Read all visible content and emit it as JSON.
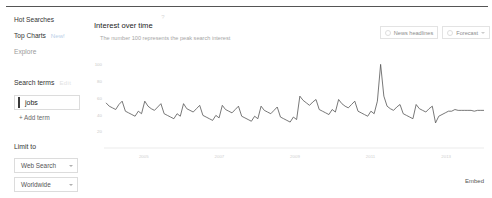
{
  "sidebar": {
    "nav": [
      {
        "label": "Hot Searches",
        "badge": "",
        "muted": false
      },
      {
        "label": "Top Charts",
        "badge": "New!",
        "muted": false
      },
      {
        "label": "Explore",
        "badge": "",
        "muted": true
      }
    ],
    "search_terms": {
      "title": "Search terms",
      "ghost": "Edit",
      "term": "jobs",
      "add_label": "+ Add term"
    },
    "limit_to": {
      "title": "Limit to",
      "options": [
        {
          "label": "Web Search"
        },
        {
          "label": "Worldwide"
        }
      ]
    }
  },
  "panel": {
    "title": "Interest over time",
    "help_icon": "question-mark-icon",
    "subtitle": "The number 100 represents the peak search interest",
    "toolbar": [
      {
        "label": "News headlines",
        "icon": "toggle-circle-icon",
        "has_caret": false
      },
      {
        "label": "Forecast",
        "icon": "toggle-circle-icon",
        "has_caret": true
      }
    ],
    "embed_label": "Embed"
  },
  "chart_data": {
    "type": "line",
    "title": "Interest over time",
    "subtitle": "The number 100 represents the peak search interest",
    "xlabel": "",
    "ylabel": "",
    "ylim": [
      0,
      110
    ],
    "yticks": [
      100,
      80,
      60,
      40,
      20
    ],
    "xticks": [
      "2005",
      "2007",
      "2009",
      "2011",
      "2013"
    ],
    "grid": false,
    "legend_position": "none",
    "series": [
      {
        "name": "jobs",
        "color": "#555555",
        "values": [
          54,
          50,
          48,
          46,
          52,
          56,
          44,
          42,
          40,
          38,
          44,
          41,
          56,
          50,
          47,
          45,
          49,
          53,
          41,
          39,
          37,
          35,
          41,
          38,
          53,
          47,
          45,
          43,
          47,
          51,
          39,
          37,
          35,
          33,
          39,
          36,
          51,
          46,
          44,
          42,
          46,
          50,
          38,
          36,
          34,
          32,
          38,
          35,
          50,
          45,
          43,
          41,
          45,
          49,
          37,
          35,
          33,
          31,
          37,
          34,
          62,
          57,
          54,
          51,
          55,
          58,
          46,
          44,
          42,
          40,
          46,
          43,
          58,
          53,
          50,
          48,
          52,
          56,
          44,
          42,
          40,
          38,
          44,
          41,
          56,
          100,
          62,
          50,
          47,
          45,
          49,
          52,
          41,
          39,
          37,
          35,
          52,
          47,
          45,
          43,
          47,
          50,
          30,
          38,
          40,
          42,
          44,
          44,
          46,
          45,
          45,
          45,
          45,
          45,
          44,
          45,
          45,
          45
        ]
      }
    ]
  }
}
